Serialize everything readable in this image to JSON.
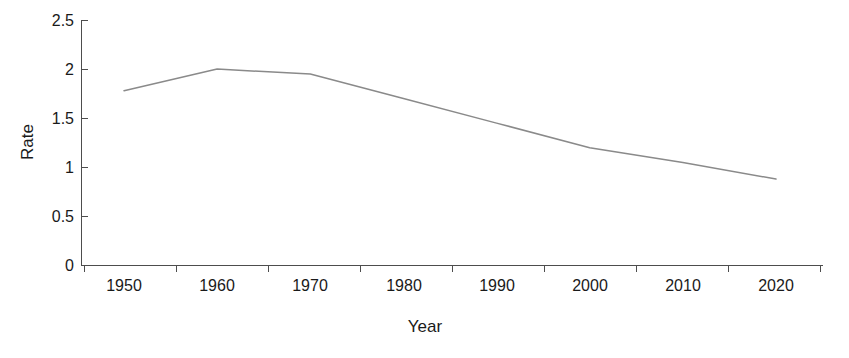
{
  "chart_data": {
    "type": "line",
    "title": "",
    "xlabel": "Year",
    "ylabel": "Rate",
    "x": [
      1950,
      1960,
      1970,
      1980,
      1990,
      2000,
      2010,
      2020
    ],
    "categories": [
      "1950",
      "1960",
      "1970",
      "1980",
      "1990",
      "2000",
      "2010",
      "2020"
    ],
    "series": [
      {
        "name": "Rate",
        "values": [
          1.78,
          2.0,
          1.95,
          1.7,
          1.45,
          1.2,
          1.05,
          0.88
        ],
        "color": "#8a8a8a"
      }
    ],
    "xlim": [
      1945,
      2025
    ],
    "ylim": [
      0,
      2.5
    ],
    "x_ticks": [
      "1950",
      "1960",
      "1970",
      "1980",
      "1990",
      "2000",
      "2010",
      "2020"
    ],
    "y_ticks": [
      "0",
      "0.5",
      "1",
      "1.5",
      "2",
      "2.5"
    ],
    "y_tick_values": [
      0,
      0.5,
      1,
      1.5,
      2,
      2.5
    ],
    "grid": "off",
    "legend": "none",
    "background_color": "#ffffff",
    "axis_color": "#4d4d4d"
  }
}
